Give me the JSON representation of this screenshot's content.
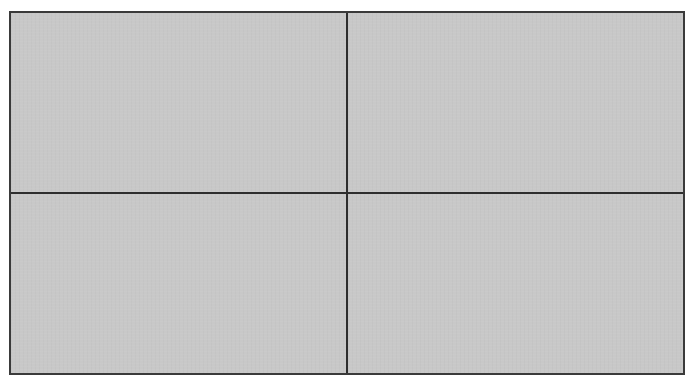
{
  "layout": {
    "type": "grid",
    "rows": 2,
    "columns": 2,
    "panes": [
      {
        "id": "top-left",
        "content": ""
      },
      {
        "id": "top-right",
        "content": ""
      },
      {
        "id": "bottom-left",
        "content": ""
      },
      {
        "id": "bottom-right",
        "content": ""
      }
    ]
  },
  "colors": {
    "pane_background": "#c8c8c8",
    "border": "#2e2e2e",
    "page_background": "#ffffff"
  }
}
